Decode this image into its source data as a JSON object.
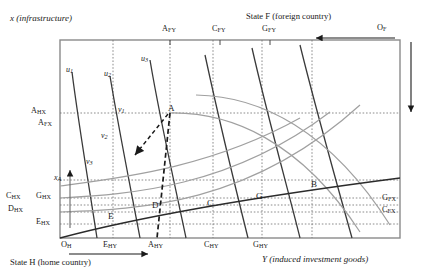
{
  "diagram": {
    "type": "edgeworth-box",
    "title_top_left": "x  (infrastructure)",
    "title_top_right": "State F (foreign country)",
    "title_bottom_left": "State H (home country)",
    "title_bottom_right": "Y  (induced  investment  goods)",
    "origin_home": "O",
    "origin_home_sub": "H",
    "origin_foreign": "O",
    "origin_foreign_sub": "F"
  },
  "plot_frame": {
    "left": 60,
    "top": 40,
    "right": 400,
    "bottom": 238
  },
  "axes": {
    "top_ticks": [
      {
        "label": "A",
        "sub": "FY",
        "x": 170
      },
      {
        "label": "C",
        "sub": "FY",
        "x": 220
      },
      {
        "label": "G",
        "sub": "FY",
        "x": 270
      }
    ],
    "bottom_ticks": [
      {
        "label": "E",
        "sub": "HY",
        "x": 113
      },
      {
        "label": "A",
        "sub": "HY",
        "x": 157
      },
      {
        "label": "C",
        "sub": "HY",
        "x": 213
      },
      {
        "label": "G",
        "sub": "HY",
        "x": 262
      }
    ],
    "left_ticks": [
      {
        "label": "A",
        "sub": "HX",
        "y": 113
      },
      {
        "label": "A",
        "sub": "FX",
        "y": 124
      },
      {
        "label": "x",
        "sub": "A",
        "y": 180,
        "italic": true
      },
      {
        "label": "C",
        "sub": "HX",
        "y": 198
      },
      {
        "label": "G",
        "sub": "HX",
        "y": 198
      },
      {
        "label": "D",
        "sub": "HX",
        "y": 211
      },
      {
        "label": "E",
        "sub": "HX",
        "y": 224
      }
    ],
    "right_ticks": [
      {
        "label": "G",
        "sub": "FX",
        "y": 200
      },
      {
        "label": "C",
        "sub": "FX",
        "y": 212
      }
    ]
  },
  "curves": {
    "home_indifference": [
      {
        "name": "u",
        "sub": "1"
      },
      {
        "name": "u",
        "sub": "2"
      },
      {
        "name": "u",
        "sub": "3"
      }
    ],
    "foreign_indifference": [
      {
        "name": "v",
        "sub": "1"
      },
      {
        "name": "v",
        "sub": "2"
      },
      {
        "name": "v",
        "sub": "3"
      }
    ]
  },
  "points": [
    {
      "label": "A",
      "x": 170,
      "y": 113
    },
    {
      "label": "B",
      "x": 312,
      "y": 188
    },
    {
      "label": "C",
      "x": 213,
      "y": 205
    },
    {
      "label": "D",
      "x": 157,
      "y": 208
    },
    {
      "label": "E",
      "x": 113,
      "y": 218
    },
    {
      "label": "G",
      "x": 262,
      "y": 199
    }
  ],
  "colors": {
    "frame": "#8a8a8a",
    "home_curve": "#3a3a3a",
    "foreign_curve": "#9a9a9a",
    "grid": "#707070",
    "contract_curve": "#2b2b2b",
    "arrow": "#1a1a1a"
  }
}
